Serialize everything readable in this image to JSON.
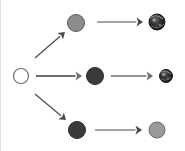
{
  "canvas": {
    "width": 185,
    "height": 151,
    "background": "#ffffff",
    "left_border_color": "#e2e2e2"
  },
  "diagram": {
    "type": "branching-circle-flow",
    "arrow_color": "#4a4a4a",
    "nodes": [
      {
        "id": "source",
        "name": "source-circle",
        "label": "",
        "cx": 21,
        "cy": 76,
        "r": 7.5,
        "fill": "#ffffff",
        "stroke": "#6e6e6e",
        "stroke_width": 1.2,
        "texture": "none"
      },
      {
        "id": "top-mid",
        "name": "top-row-middle-circle",
        "label": "",
        "cx": 76,
        "cy": 23,
        "r": 8.5,
        "fill": "#8c8c8c",
        "stroke": "#5a5a5a",
        "stroke_width": 1.0,
        "texture": "none"
      },
      {
        "id": "top-end",
        "name": "top-row-result-circle",
        "label": "",
        "cx": 157,
        "cy": 22,
        "r": 8.0,
        "fill": "#2b2b2b",
        "stroke": "#1a1a1a",
        "stroke_width": 1.0,
        "texture": "marbled"
      },
      {
        "id": "mid-mid",
        "name": "middle-row-middle-circle",
        "label": "",
        "cx": 95,
        "cy": 76,
        "r": 8.5,
        "fill": "#3a3a3a",
        "stroke": "#2a2a2a",
        "stroke_width": 1.0,
        "texture": "none"
      },
      {
        "id": "mid-end",
        "name": "middle-row-result-circle",
        "label": "",
        "cx": 166,
        "cy": 76,
        "r": 6.5,
        "fill": "#2b2b2b",
        "stroke": "#1a1a1a",
        "stroke_width": 1.0,
        "texture": "marbled"
      },
      {
        "id": "bot-mid",
        "name": "bottom-row-middle-circle",
        "label": "",
        "cx": 77,
        "cy": 130,
        "r": 8.5,
        "fill": "#3a3a3a",
        "stroke": "#2a2a2a",
        "stroke_width": 1.0,
        "texture": "none"
      },
      {
        "id": "bot-end",
        "name": "bottom-row-result-circle",
        "label": "",
        "cx": 157,
        "cy": 130,
        "r": 8.0,
        "fill": "#9a9a9a",
        "stroke": "#6a6a6a",
        "stroke_width": 1.0,
        "texture": "none"
      }
    ],
    "arrows": [
      {
        "id": "branch-up",
        "name": "branch-arrow-up",
        "from": "source",
        "to": "top-mid",
        "x1": 35,
        "y1": 58,
        "x2": 65,
        "y2": 32,
        "color": "#4a4a4a",
        "width": 1.2
      },
      {
        "id": "branch-mid",
        "name": "branch-arrow-straight",
        "from": "source",
        "to": "mid-mid",
        "x1": 36,
        "y1": 76,
        "x2": 82,
        "y2": 76,
        "color": "#6e6e6e",
        "width": 1.8
      },
      {
        "id": "branch-down",
        "name": "branch-arrow-down",
        "from": "source",
        "to": "bot-mid",
        "x1": 35,
        "y1": 94,
        "x2": 66,
        "y2": 120,
        "color": "#4a4a4a",
        "width": 1.2
      },
      {
        "id": "top-transform",
        "name": "top-row-transform-arrow",
        "from": "top-mid",
        "to": "top-end",
        "x1": 97,
        "y1": 22,
        "x2": 143,
        "y2": 22,
        "color": "#4a4a4a",
        "width": 1.2
      },
      {
        "id": "mid-transform",
        "name": "middle-row-transform-arrow",
        "from": "mid-mid",
        "to": "mid-end",
        "x1": 111,
        "y1": 76,
        "x2": 153,
        "y2": 76,
        "color": "#6e6e6e",
        "width": 1.4
      },
      {
        "id": "bot-transform",
        "name": "bottom-row-transform-arrow",
        "from": "bot-mid",
        "to": "bot-end",
        "x1": 95,
        "y1": 130,
        "x2": 142,
        "y2": 130,
        "color": "#4a4a4a",
        "width": 1.2
      }
    ]
  }
}
